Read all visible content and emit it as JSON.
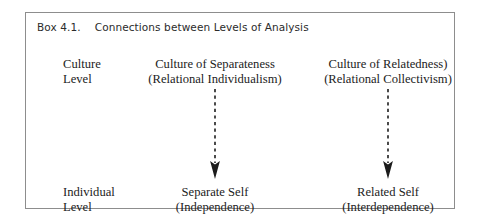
{
  "box": {
    "title": {
      "number": "Box 4.1.",
      "text": "Connections between Levels of Analysis"
    },
    "border_color": "#8d8d8d",
    "background_color": "#ffffff",
    "text_color": "#1c1c1c"
  },
  "rows": {
    "culture": {
      "label_line1": "Culture",
      "label_line2": "Level"
    },
    "individual": {
      "label_line1": "Individual",
      "label_line2": "Level"
    }
  },
  "columns": {
    "separateness": {
      "culture_line1": "Culture of Separateness",
      "culture_line2": "(Relational Individualism)",
      "individual_line1": "Separate Self",
      "individual_line2": "(Independence)"
    },
    "relatedness": {
      "culture_line1": "Culture of Relatedness)",
      "culture_line2": "(Relational Collectivism)",
      "individual_line1": "Related Self",
      "individual_line2": "(Interdependence)"
    }
  },
  "arrows": {
    "style": "dashed-down-arrow",
    "color": "#1c1c1c",
    "left_name": "arrow-separateness-down",
    "right_name": "arrow-relatedness-down"
  }
}
